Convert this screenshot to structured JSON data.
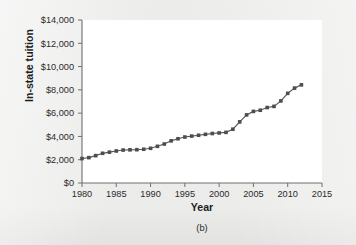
{
  "figure": {
    "caption": "(b)",
    "background_color": "#ececeb",
    "plot_background_color": "#ffffff",
    "series_color": "#4d4d4d"
  },
  "chart_data": {
    "type": "line",
    "title": "",
    "xlabel": "Year",
    "ylabel": "In-state tuition",
    "xlim": [
      1980,
      2015
    ],
    "ylim": [
      0,
      14000
    ],
    "grid": false,
    "legend": null,
    "xticks": [
      1980,
      1985,
      1990,
      1995,
      2000,
      2005,
      2010,
      2015
    ],
    "xtick_labels": [
      "1980",
      "1985",
      "1990",
      "1995",
      "2000",
      "2005",
      "2010",
      "2015"
    ],
    "yticks": [
      0,
      2000,
      4000,
      6000,
      8000,
      10000,
      12000,
      14000
    ],
    "ytick_labels": [
      "$0",
      "$2,000",
      "$4,000",
      "$6,000",
      "$8,000",
      "$10,000",
      "$12,000",
      "$14,000"
    ],
    "marker": "square",
    "x": [
      1980,
      1981,
      1982,
      1983,
      1984,
      1985,
      1986,
      1987,
      1988,
      1989,
      1990,
      1991,
      1992,
      1993,
      1994,
      1995,
      1996,
      1997,
      1998,
      1999,
      2000,
      2001,
      2002,
      2003,
      2004,
      2005,
      2006,
      2007,
      2008,
      2009,
      2010,
      2011,
      2012
    ],
    "values": [
      2100,
      2180,
      2350,
      2550,
      2650,
      2750,
      2830,
      2850,
      2860,
      2900,
      2980,
      3150,
      3350,
      3620,
      3800,
      3950,
      4030,
      4100,
      4180,
      4250,
      4300,
      4350,
      4620,
      5250,
      5850,
      6150,
      6250,
      6480,
      6580,
      7050,
      7700,
      8150,
      8430
    ],
    "series": [
      {
        "name": "In-state tuition",
        "values": [
          2100,
          2180,
          2350,
          2550,
          2650,
          2750,
          2830,
          2850,
          2860,
          2900,
          2980,
          3150,
          3350,
          3620,
          3800,
          3950,
          4030,
          4100,
          4180,
          4250,
          4300,
          4350,
          4620,
          5250,
          5850,
          6150,
          6250,
          6480,
          6580,
          7050,
          7700,
          8150,
          8430
        ]
      }
    ]
  }
}
